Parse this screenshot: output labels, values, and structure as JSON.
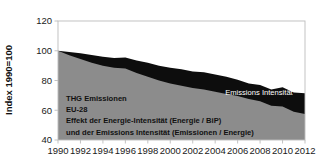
{
  "chart_data": {
    "type": "area",
    "stacked": true,
    "title": "",
    "xlabel": "",
    "ylabel": "Index 1990=100",
    "ylim": [
      40,
      120
    ],
    "xlim": [
      1990,
      2012
    ],
    "yticks": [
      40,
      60,
      80,
      100,
      120
    ],
    "xticks": [
      1990,
      1992,
      1994,
      1996,
      1998,
      2000,
      2002,
      2004,
      2006,
      2008,
      2010,
      2012
    ],
    "grid": false,
    "legend_position": "inline-right",
    "x": [
      1990,
      1991,
      1992,
      1993,
      1994,
      1995,
      1996,
      1997,
      1998,
      1999,
      2000,
      2001,
      2002,
      2003,
      2004,
      2005,
      2006,
      2007,
      2008,
      2009,
      2010,
      2011,
      2012
    ],
    "series": [
      {
        "name": "Energie-Intensität",
        "color": "#0d0d0d",
        "label_color": "#ffffff",
        "values": [
          100,
          99.2,
          98.4,
          97.2,
          96.0,
          95.2,
          95.5,
          93.5,
          92.0,
          90.0,
          88.5,
          87.5,
          86.0,
          85.5,
          84.0,
          82.5,
          80.5,
          78.0,
          77.0,
          74.0,
          75.5,
          72.0,
          71.5
        ]
      },
      {
        "name": "Emissions Intensität",
        "color": "#8c8c8c",
        "label_color": "#ffffff",
        "values": [
          100,
          97.0,
          94.5,
          92.0,
          90.0,
          88.5,
          88.0,
          85.0,
          82.5,
          80.0,
          78.0,
          76.5,
          75.0,
          74.0,
          72.5,
          71.0,
          69.5,
          67.5,
          66.0,
          63.0,
          62.5,
          59.0,
          57.5
        ]
      }
    ],
    "area_labels": [
      {
        "text": "Energie-Intensität",
        "x": 2007.6,
        "y": 89.0,
        "style": "on-dark"
      },
      {
        "text": "Emissions Intensität",
        "x": 2007.9,
        "y": 70.5,
        "style": "on-gray"
      }
    ],
    "total_label": {
      "line1": "Gesamt-",
      "line2": "Intensität",
      "x": 2008.6,
      "y": 53.5
    },
    "annotation": {
      "lines": [
        "THG Emissionen",
        "EU-28",
        "Effekt der Energie-Intensität (Energie / BiP)",
        "und der Emissions Intensität (Emissionen / Energie)"
      ]
    }
  }
}
